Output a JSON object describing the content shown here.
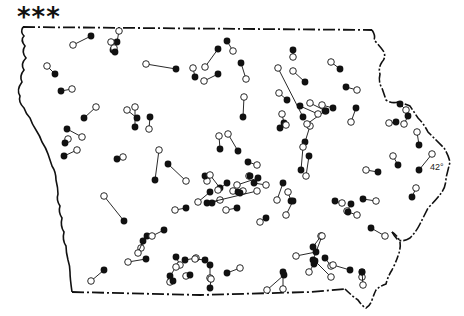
{
  "figure": {
    "corner_marker": "***",
    "latitude_label": "42°",
    "latitude_label_pos": [
      430,
      162
    ],
    "colors": {
      "stroke": "#111111",
      "background": "#ffffff",
      "filled": "#111111",
      "open": "#ffffff"
    }
  },
  "legend_note": "open circle = one end of pair, filled circle = other end",
  "boundary": {
    "north_y": 27,
    "description": "Iowa state outline; dash-dot political borders on north and south, wavy river borders on east and west"
  },
  "pairs": [
    {
      "open": [
        73,
        45
      ],
      "filled": [
        91,
        36
      ]
    },
    {
      "open": [
        119,
        31
      ],
      "filled": [
        117,
        42
      ]
    },
    {
      "open": [
        111,
        42
      ],
      "filled": [
        113,
        50
      ]
    },
    {
      "open": [
        114,
        48
      ],
      "filled": [
        115,
        52
      ]
    },
    {
      "open": [
        47,
        66
      ],
      "filled": [
        55,
        74
      ]
    },
    {
      "open": [
        72,
        89
      ],
      "filled": [
        61,
        91
      ]
    },
    {
      "open": [
        146,
        64
      ],
      "filled": [
        176,
        69
      ]
    },
    {
      "open": [
        193,
        68
      ],
      "filled": [
        195,
        77
      ]
    },
    {
      "open": [
        205,
        67
      ],
      "filled": [
        218,
        49
      ]
    },
    {
      "open": [
        204,
        81
      ],
      "filled": [
        218,
        74
      ]
    },
    {
      "open": [
        233,
        51
      ],
      "filled": [
        227,
        41
      ]
    },
    {
      "open": [
        246,
        79
      ],
      "filled": [
        241,
        63
      ]
    },
    {
      "open": [
        244,
        97
      ],
      "filled": [
        243,
        117
      ]
    },
    {
      "open": [
        228,
        134
      ],
      "filled": [
        238,
        151
      ]
    },
    {
      "open": [
        219,
        136
      ],
      "filled": [
        220,
        149
      ]
    },
    {
      "open": [
        293,
        57
      ],
      "filled": [
        293,
        50
      ]
    },
    {
      "open": [
        278,
        68
      ],
      "filled": [
        303,
        117
      ]
    },
    {
      "open": [
        293,
        71
      ],
      "filled": [
        305,
        82
      ]
    },
    {
      "open": [
        279,
        93
      ],
      "filled": [
        287,
        100
      ]
    },
    {
      "open": [
        282,
        114
      ],
      "filled": [
        284,
        123
      ]
    },
    {
      "open": [
        286,
        125
      ],
      "filled": [
        280,
        128
      ]
    },
    {
      "open": [
        310,
        126
      ],
      "filled": [
        305,
        142
      ]
    },
    {
      "open": [
        331,
        62
      ],
      "filled": [
        340,
        69
      ]
    },
    {
      "open": [
        310,
        103
      ],
      "filled": [
        326,
        111
      ]
    },
    {
      "open": [
        307,
        124
      ],
      "filled": [
        325,
        111
      ]
    },
    {
      "open": [
        318,
        114
      ],
      "filled": [
        300,
        106
      ]
    },
    {
      "open": [
        357,
        90
      ],
      "filled": [
        346,
        87
      ]
    },
    {
      "open": [
        351,
        122
      ],
      "filled": [
        356,
        108
      ]
    },
    {
      "open": [
        322,
        105
      ],
      "filled": [
        333,
        108
      ]
    },
    {
      "open": [
        406,
        110
      ],
      "filled": [
        400,
        104
      ]
    },
    {
      "open": [
        404,
        124
      ],
      "filled": [
        408,
        116
      ]
    },
    {
      "open": [
        389,
        123
      ],
      "filled": [
        396,
        122
      ]
    },
    {
      "open": [
        417,
        132
      ],
      "filled": [
        419,
        145
      ]
    },
    {
      "open": [
        393,
        156
      ],
      "filled": [
        398,
        165
      ]
    },
    {
      "open": [
        432,
        154
      ],
      "filled": [
        419,
        170
      ]
    },
    {
      "open": [
        366,
        170
      ],
      "filled": [
        378,
        172
      ]
    },
    {
      "open": [
        416,
        188
      ],
      "filled": [
        412,
        197
      ]
    },
    {
      "open": [
        82,
        137
      ],
      "filled": [
        67,
        129
      ]
    },
    {
      "open": [
        68,
        139
      ],
      "filled": [
        65,
        143
      ]
    },
    {
      "open": [
        77,
        150
      ],
      "filled": [
        64,
        156
      ]
    },
    {
      "open": [
        96,
        107
      ],
      "filled": [
        84,
        118
      ]
    },
    {
      "open": [
        127,
        110
      ],
      "filled": [
        137,
        118
      ]
    },
    {
      "open": [
        135,
        107
      ],
      "filled": [
        135,
        127
      ]
    },
    {
      "open": [
        149,
        129
      ],
      "filled": [
        150,
        117
      ]
    },
    {
      "open": [
        123,
        157
      ],
      "filled": [
        117,
        159
      ]
    },
    {
      "open": [
        159,
        150
      ],
      "filled": [
        155,
        180
      ]
    },
    {
      "open": [
        186,
        181
      ],
      "filled": [
        168,
        164
      ]
    },
    {
      "open": [
        104,
        196
      ],
      "filled": [
        124,
        221
      ]
    },
    {
      "open": [
        175,
        210
      ],
      "filled": [
        186,
        208
      ]
    },
    {
      "open": [
        198,
        202
      ],
      "filled": [
        210,
        192
      ]
    },
    {
      "open": [
        207,
        181
      ],
      "filled": [
        205,
        176
      ]
    },
    {
      "open": [
        210,
        175
      ],
      "filled": [
        220,
        188
      ]
    },
    {
      "open": [
        218,
        190
      ],
      "filled": [
        227,
        183
      ]
    },
    {
      "open": [
        233,
        191
      ],
      "filled": [
        238,
        192
      ]
    },
    {
      "open": [
        237,
        185
      ],
      "filled": [
        258,
        178
      ]
    },
    {
      "open": [
        257,
        165
      ],
      "filled": [
        248,
        162
      ]
    },
    {
      "open": [
        249,
        176
      ],
      "filled": [
        250,
        176
      ]
    },
    {
      "open": [
        220,
        200
      ],
      "filled": [
        212,
        203
      ]
    },
    {
      "open": [
        226,
        210
      ],
      "filled": [
        237,
        208
      ]
    },
    {
      "open": [
        243,
        191
      ],
      "filled": [
        240,
        193
      ]
    },
    {
      "open": [
        257,
        191
      ],
      "filled": [
        207,
        203
      ]
    },
    {
      "open": [
        266,
        185
      ],
      "filled": [
        254,
        183
      ]
    },
    {
      "open": [
        277,
        200
      ],
      "filled": [
        283,
        183
      ]
    },
    {
      "open": [
        288,
        192
      ],
      "filled": [
        291,
        201
      ]
    },
    {
      "open": [
        286,
        215
      ],
      "filled": [
        293,
        201
      ]
    },
    {
      "open": [
        260,
        222
      ],
      "filled": [
        266,
        218
      ]
    },
    {
      "open": [
        303,
        147
      ],
      "filled": [
        301,
        170
      ]
    },
    {
      "open": [
        306,
        176
      ],
      "filled": [
        309,
        156
      ]
    },
    {
      "open": [
        321,
        236
      ],
      "filled": [
        313,
        247
      ]
    },
    {
      "open": [
        342,
        203
      ],
      "filled": [
        335,
        201
      ]
    },
    {
      "open": [
        347,
        211
      ],
      "filled": [
        351,
        204
      ]
    },
    {
      "open": [
        376,
        201
      ],
      "filled": [
        363,
        199
      ]
    },
    {
      "open": [
        385,
        236
      ],
      "filled": [
        371,
        228
      ]
    },
    {
      "open": [
        357,
        215
      ],
      "filled": [
        348,
        212
      ]
    },
    {
      "open": [
        322,
        236
      ],
      "filled": [
        313,
        260
      ]
    },
    {
      "open": [
        296,
        256
      ],
      "filled": [
        316,
        252
      ]
    },
    {
      "open": [
        309,
        272
      ],
      "filled": [
        314,
        264
      ]
    },
    {
      "open": [
        331,
        266
      ],
      "filled": [
        325,
        258
      ]
    },
    {
      "open": [
        333,
        265
      ],
      "filled": [
        350,
        270
      ]
    },
    {
      "open": [
        331,
        277
      ],
      "filled": [
        315,
        261
      ]
    },
    {
      "open": [
        362,
        277
      ],
      "filled": [
        362,
        272
      ]
    },
    {
      "open": [
        363,
        285
      ],
      "filled": [
        362,
        272
      ]
    },
    {
      "open": [
        283,
        289
      ],
      "filled": [
        283,
        272
      ]
    },
    {
      "open": [
        267,
        290
      ],
      "filled": [
        284,
        275
      ]
    },
    {
      "open": [
        240,
        268
      ],
      "filled": [
        227,
        273
      ]
    },
    {
      "open": [
        210,
        278
      ],
      "filled": [
        210,
        265
      ]
    },
    {
      "open": [
        196,
        258
      ],
      "filled": [
        185,
        260
      ]
    },
    {
      "open": [
        180,
        265
      ],
      "filled": [
        176,
        257
      ]
    },
    {
      "open": [
        176,
        267
      ],
      "filled": [
        170,
        276
      ]
    },
    {
      "open": [
        186,
        276
      ],
      "filled": [
        190,
        275
      ]
    },
    {
      "open": [
        170,
        282
      ],
      "filled": [
        173,
        281
      ]
    },
    {
      "open": [
        211,
        279
      ],
      "filled": [
        210,
        288
      ]
    },
    {
      "open": [
        128,
        262
      ],
      "filled": [
        146,
        259
      ]
    },
    {
      "open": [
        141,
        248
      ],
      "filled": [
        147,
        236
      ]
    },
    {
      "open": [
        138,
        253
      ],
      "filled": [
        143,
        241
      ]
    },
    {
      "open": [
        152,
        236
      ],
      "filled": [
        164,
        230
      ]
    },
    {
      "open": [
        91,
        281
      ],
      "filled": [
        104,
        270
      ]
    },
    {
      "open": [
        195,
        259
      ],
      "filled": [
        205,
        260
      ]
    }
  ]
}
